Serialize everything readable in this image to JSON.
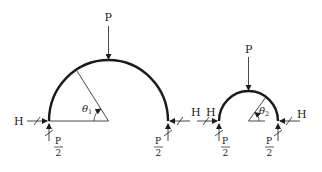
{
  "colors": {
    "ink": "#1a1a1a",
    "background": "#ffffff"
  },
  "arch_large": {
    "load_label": "P",
    "angle_label": "θ",
    "angle_subscript": "1",
    "left_horizontal_label": "H",
    "right_horizontal_label": "H",
    "left_reaction": {
      "numerator": "P",
      "denominator": "2"
    },
    "right_reaction": {
      "numerator": "P",
      "denominator": "2"
    }
  },
  "arch_small": {
    "load_label": "P",
    "angle_label": "θ",
    "angle_subscript": "2",
    "left_horizontal_label": "H",
    "right_horizontal_label": "H",
    "left_reaction": {
      "numerator": "P",
      "denominator": "2"
    },
    "right_reaction": {
      "numerator": "P",
      "denominator": "2"
    }
  }
}
